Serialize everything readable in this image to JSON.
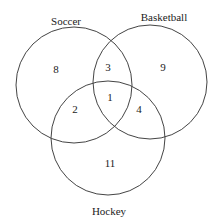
{
  "diagram": {
    "type": "venn",
    "sets": [
      {
        "label": "Soccer",
        "cx": 74,
        "cy": 85,
        "r": 58,
        "label_x": 66,
        "label_y": 22
      },
      {
        "label": "Basketball",
        "cx": 150,
        "cy": 82,
        "r": 57,
        "label_x": 164,
        "label_y": 18
      },
      {
        "label": "Hockey",
        "cx": 108,
        "cy": 138,
        "r": 57,
        "label_x": 109,
        "label_y": 212
      }
    ],
    "regions": [
      {
        "name": "soccer-only",
        "value": "8",
        "x": 56,
        "y": 70
      },
      {
        "name": "soccer-basketball",
        "value": "3",
        "x": 108,
        "y": 68
      },
      {
        "name": "basketball-only",
        "value": "9",
        "x": 163,
        "y": 68
      },
      {
        "name": "all-three",
        "value": "1",
        "x": 110,
        "y": 98
      },
      {
        "name": "soccer-hockey",
        "value": "2",
        "x": 75,
        "y": 110
      },
      {
        "name": "basketball-hockey",
        "value": "4",
        "x": 139,
        "y": 110
      },
      {
        "name": "hockey-only",
        "value": "11",
        "x": 110,
        "y": 164
      }
    ]
  }
}
